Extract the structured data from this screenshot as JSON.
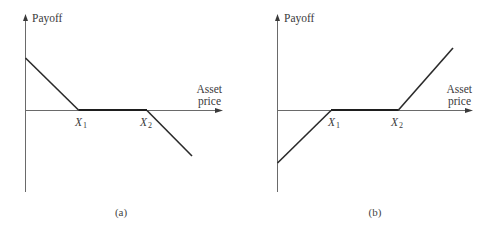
{
  "panels": [
    {
      "id": "a",
      "caption": "(a)",
      "y_axis_label": "Payoff",
      "x_axis_label_line1": "Asset",
      "x_axis_label_line2": "price",
      "strike_labels": [
        {
          "main": "X",
          "sub": "1"
        },
        {
          "main": "X",
          "sub": "2"
        }
      ],
      "payoff_shape": {
        "description": "Positive payoff declining linearly to zero at X1, zero between X1 and X2, negative and declining beyond X2",
        "slope_below_X1": -1,
        "slope_between": 0,
        "slope_above_X2": -1
      }
    },
    {
      "id": "b",
      "caption": "(b)",
      "y_axis_label": "Payoff",
      "x_axis_label_line1": "Asset",
      "x_axis_label_line2": "price",
      "strike_labels": [
        {
          "main": "X",
          "sub": "1"
        },
        {
          "main": "X",
          "sub": "2"
        }
      ],
      "payoff_shape": {
        "description": "Negative payoff rising linearly to zero at X1, zero between X1 and X2, positive and rising beyond X2",
        "slope_below_X1": 1,
        "slope_between": 0,
        "slope_above_X2": 1
      }
    }
  ]
}
